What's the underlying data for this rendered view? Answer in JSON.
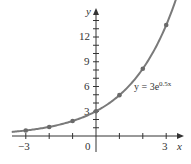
{
  "chart_data": {
    "type": "line",
    "title": "",
    "xlabel": "x",
    "ylabel": "y",
    "xlim": [
      -3.5,
      3.6
    ],
    "ylim": [
      -1.5,
      15
    ],
    "grid": false,
    "x_ticks": [
      -3,
      -2,
      -1,
      0,
      1,
      2,
      3
    ],
    "x_tick_labels": [
      "-3",
      "0",
      "3"
    ],
    "y_ticks": [
      1,
      2,
      3,
      4,
      5,
      6,
      7,
      8,
      9,
      10,
      11,
      12,
      13,
      14
    ],
    "y_tick_labels": [
      "3",
      "6",
      "9",
      "12"
    ],
    "series": [
      {
        "name": "y = 3e^{0.5x}",
        "x": [
          -3,
          -2,
          -1,
          0,
          1,
          2,
          3
        ],
        "values": [
          0.67,
          1.1,
          1.82,
          3.0,
          4.95,
          8.15,
          13.45
        ],
        "markers": true
      }
    ],
    "annotations": [
      {
        "text": "y = 3e",
        "superscript": "0.5x",
        "x": 1.4,
        "y": 6.2
      }
    ],
    "colors": {
      "curve": "#7a7a7a",
      "marker": "#6a6a6a",
      "axis": "#333333"
    }
  },
  "labels": {
    "x_axis_name": "x",
    "y_axis_name": "y",
    "x_neg3": "−3",
    "x_zero": "0",
    "x_pos3": "3",
    "y_3": "3",
    "y_6": "6",
    "y_9": "9",
    "y_12": "12",
    "equation_base": "y = 3e",
    "equation_exp": "0.5x"
  }
}
